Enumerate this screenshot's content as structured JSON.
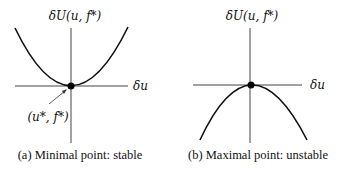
{
  "panels": [
    {
      "id": "a",
      "y_label": "δU(u, f*)",
      "x_label": "δu",
      "point_label": "(u*, f*)",
      "curve_shape": "convex-parabola",
      "extremum": "minimum",
      "caption": "(a) Minimal point: stable"
    },
    {
      "id": "b",
      "y_label": "δU(u, f*)",
      "x_label": "δu",
      "curve_shape": "concave-parabola",
      "extremum": "maximum",
      "caption": "(b) Maximal point: unstable"
    }
  ],
  "colors": {
    "curve": "#111111",
    "axis": "#444444",
    "point": "#000000"
  }
}
